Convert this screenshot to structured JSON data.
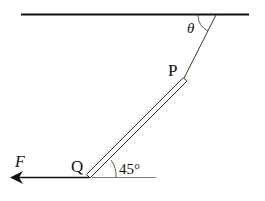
{
  "diagram": {
    "labels": {
      "theta": "θ",
      "point_p": "P",
      "point_q": "Q",
      "force": "F",
      "angle_rod": "45°"
    },
    "colors": {
      "stroke": "#111111",
      "background": "#ffffff"
    }
  }
}
